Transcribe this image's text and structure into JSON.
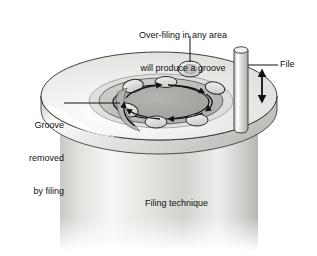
{
  "figure": {
    "caption": "Filing technique"
  },
  "labels": {
    "overfill": {
      "line1": "Over-filing in any area",
      "line2": "will produce a groove",
      "leader": "vertical-leader-line"
    },
    "groove": {
      "line1": "Groove",
      "line2": "removed",
      "line3": "by filing",
      "leader": "horizontal-leader-line"
    },
    "file": {
      "text": "File",
      "leader": "horizontal-leader-line"
    }
  },
  "colors": {
    "outline": "#1a1a1a",
    "text": "#111111",
    "disc_top": "#e9e9e7",
    "disc_rim": "#c9c9c6",
    "body_light": "#f2f2f0",
    "body_mid": "#d2d2cf",
    "body_dark": "#a8a8a4",
    "canal_fill": "#a9a9a6",
    "canal_ring": "#bdbdba",
    "lobe_fill": "#dcdcd9",
    "file_light": "#f0f0ee",
    "file_mid": "#c2c2bf",
    "highlight": "#ffffff"
  },
  "annotations": {
    "motion_arrow": "double-headed-vertical-arrow",
    "canal_direction_arrows": 6,
    "lobe_count": 7
  }
}
